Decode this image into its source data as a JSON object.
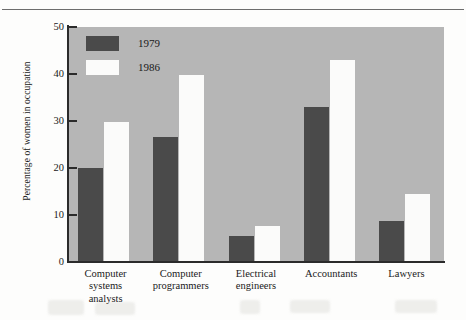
{
  "chart_data": {
    "type": "bar",
    "title": "",
    "subtitle": "",
    "xlabel": "",
    "ylabel": "Percentage of women in occupation",
    "ylim": [
      0,
      50
    ],
    "yticks": [
      0,
      10,
      20,
      30,
      40,
      50
    ],
    "grid": false,
    "legend_position": "top-left inside plot",
    "categories": [
      "Computer systems analysts",
      "Computer programmers",
      "Electrical engineers",
      "Accountants",
      "Lawyers"
    ],
    "category_lines": [
      [
        "Computer",
        "systems",
        "analysts"
      ],
      [
        "Computer",
        "programmers"
      ],
      [
        "Electrical",
        "engineers"
      ],
      [
        "Accountants"
      ],
      [
        "Lawyers"
      ]
    ],
    "series": [
      {
        "name": "1979",
        "color": "#4a4a4a",
        "values": [
          20.0,
          26.5,
          5.5,
          33.0,
          8.8
        ]
      },
      {
        "name": "1986",
        "color": "#fbfbfa",
        "values": [
          29.7,
          39.8,
          7.7,
          43.0,
          14.5
        ]
      }
    ]
  },
  "legend": {
    "items": [
      {
        "label": "1979",
        "swatch": "#4a4a4a"
      },
      {
        "label": "1986",
        "swatch": "#fbfbfa"
      }
    ]
  },
  "axis": {
    "y_label": "Percentage of women in occupation",
    "y_tick_labels": [
      "50",
      "40",
      "30",
      "20",
      "10",
      "0"
    ]
  },
  "colors": {
    "plot_background": "#b6b6b6",
    "series_1979": "#4a4a4a",
    "series_1986": "#fbfbfa",
    "axis": "#2b2b2b",
    "page": "#fdfdfc"
  }
}
